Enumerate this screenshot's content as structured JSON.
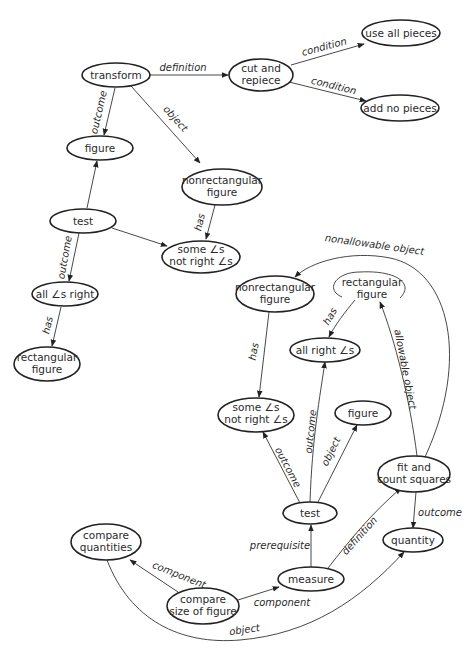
{
  "diagram": {
    "type": "concept-map",
    "nodes": {
      "transform": {
        "label": [
          "transform"
        ],
        "x": 116,
        "y": 75,
        "rx": 33,
        "ry": 12
      },
      "cut_and_repiece": {
        "label": [
          "cut and",
          "repiece"
        ],
        "x": 261,
        "y": 75,
        "rx": 32,
        "ry": 16
      },
      "use_all_pieces": {
        "label": [
          "use all pieces"
        ],
        "x": 400,
        "y": 33,
        "rx": 39,
        "ry": 13
      },
      "add_no_pieces": {
        "label": [
          "add no pieces"
        ],
        "x": 399,
        "y": 108,
        "rx": 39,
        "ry": 13
      },
      "figure_top": {
        "label": [
          "figure"
        ],
        "x": 100,
        "y": 148,
        "rx": 33,
        "ry": 12
      },
      "nonrect_top": {
        "label": [
          "nonrectangular",
          "figure"
        ],
        "x": 220,
        "y": 187,
        "rx": 40,
        "ry": 18
      },
      "test_top": {
        "label": [
          "test"
        ],
        "x": 83,
        "y": 221,
        "rx": 33,
        "ry": 12
      },
      "some_angles_top": {
        "label": [
          "some ∠s",
          "not right ∠s"
        ],
        "x": 200,
        "y": 256,
        "rx": 39,
        "ry": 16
      },
      "all_angles_right": {
        "label": [
          "all ∠s right"
        ],
        "x": 65,
        "y": 294,
        "rx": 33,
        "ry": 12
      },
      "rect_left": {
        "label": [
          "rectangular",
          "figure"
        ],
        "x": 47,
        "y": 364,
        "rx": 33,
        "ry": 17
      },
      "nonrect_mid": {
        "label": [
          "nonrectangular",
          "figure"
        ],
        "x": 275,
        "y": 294,
        "rx": 39,
        "ry": 18
      },
      "rect_mid": {
        "label": [
          "rectangular",
          "figure"
        ],
        "x": 373,
        "y": 287,
        "rx": 38,
        "ry": 15
      },
      "all_right_angles": {
        "label": [
          "all right ∠s"
        ],
        "x": 325,
        "y": 350,
        "rx": 35,
        "ry": 12
      },
      "some_angles_mid": {
        "label": [
          "some ∠s",
          "not right ∠s"
        ],
        "x": 257,
        "y": 415,
        "rx": 38,
        "ry": 17
      },
      "figure_mid": {
        "label": [
          "figure"
        ],
        "x": 362,
        "y": 413,
        "rx": 27,
        "ry": 12
      },
      "fit_and_count": {
        "label": [
          "fit and",
          "count squares"
        ],
        "x": 413,
        "y": 474,
        "rx": 36,
        "ry": 18
      },
      "test_mid": {
        "label": [
          "test"
        ],
        "x": 310,
        "y": 513,
        "rx": 26,
        "ry": 11
      },
      "quantity": {
        "label": [
          "quantity"
        ],
        "x": 413,
        "y": 540,
        "rx": 30,
        "ry": 12
      },
      "compare_quantities": {
        "label": [
          "compare",
          "quantities"
        ],
        "x": 106,
        "y": 542,
        "rx": 35,
        "ry": 18
      },
      "measure": {
        "label": [
          "measure"
        ],
        "x": 311,
        "y": 579,
        "rx": 33,
        "ry": 12
      },
      "compare_size": {
        "label": [
          "compare",
          "size of figure"
        ],
        "x": 203,
        "y": 606,
        "rx": 36,
        "ry": 18
      }
    },
    "edges": [
      {
        "from": "transform",
        "to": "cut_and_repiece",
        "label": "definition"
      },
      {
        "from": "cut_and_repiece",
        "to": "use_all_pieces",
        "label": "condition"
      },
      {
        "from": "cut_and_repiece",
        "to": "add_no_pieces",
        "label": "condition"
      },
      {
        "from": "transform",
        "to": "figure_top",
        "label": "outcome"
      },
      {
        "from": "transform",
        "to": "nonrect_top",
        "label": "object"
      },
      {
        "from": "nonrect_top",
        "to": "some_angles_top",
        "label": "has"
      },
      {
        "from": "test_top",
        "to": "figure_top",
        "label": ""
      },
      {
        "from": "test_top",
        "to": "some_angles_top",
        "label": ""
      },
      {
        "from": "test_top",
        "to": "all_angles_right",
        "label": "outcome"
      },
      {
        "from": "all_angles_right",
        "to": "rect_left",
        "label": "has"
      },
      {
        "from": "fit_and_count",
        "to": "nonrect_mid",
        "label": "nonallowable object"
      },
      {
        "from": "rect_mid",
        "to": "all_right_angles",
        "label": "has"
      },
      {
        "from": "fit_and_count",
        "to": "rect_mid",
        "label": "allowable object"
      },
      {
        "from": "nonrect_mid",
        "to": "some_angles_mid",
        "label": "has"
      },
      {
        "from": "test_mid",
        "to": "some_angles_mid",
        "label": "outcome"
      },
      {
        "from": "test_mid",
        "to": "all_right_angles",
        "label": "outcome"
      },
      {
        "from": "test_mid",
        "to": "figure_mid",
        "label": "object"
      },
      {
        "from": "fit_and_count",
        "to": "quantity",
        "label": "outcome"
      },
      {
        "from": "measure",
        "to": "test_mid",
        "label": "prerequisite"
      },
      {
        "from": "measure",
        "to": "fit_and_count",
        "label": "definition"
      },
      {
        "from": "compare_size",
        "to": "compare_quantities",
        "label": "component"
      },
      {
        "from": "compare_size",
        "to": "measure",
        "label": "component"
      },
      {
        "from": "compare_quantities",
        "to": "quantity",
        "label": "object"
      }
    ]
  },
  "labels": {
    "definition_top": "definition",
    "condition_1": "condition",
    "condition_2": "condition",
    "outcome_transform": "outcome",
    "object_transform": "object",
    "has_nonrect_top": "has",
    "outcome_test_top": "outcome",
    "has_all_right": "has",
    "nonallowable": "nonallowable object",
    "has_rect_mid": "has",
    "allowable": "allowable object",
    "has_nonrect_mid": "has",
    "outcome_some": "outcome",
    "outcome_allright": "outcome",
    "object_figure": "object",
    "outcome_quantity": "outcome",
    "prerequisite": "prerequisite",
    "definition_measure": "definition",
    "component_cq": "component",
    "component_measure": "component",
    "object_quantity": "object"
  },
  "node_text": {
    "transform": "transform",
    "cut_1": "cut and",
    "cut_2": "repiece",
    "use_all": "use all pieces",
    "add_no": "add no pieces",
    "figure_top": "figure",
    "nonrect_top_1": "nonrectangular",
    "nonrect_top_2": "figure",
    "test_top": "test",
    "some_top_1": "some ∠s",
    "some_top_2": "not right ∠s",
    "all_right_left": "all ∠s right",
    "rect_left_1": "rectangular",
    "rect_left_2": "figure",
    "nonrect_mid_1": "nonrectangular",
    "nonrect_mid_2": "figure",
    "rect_mid_1": "rectangular",
    "rect_mid_2": "figure",
    "all_right_mid": "all right ∠s",
    "some_mid_1": "some ∠s",
    "some_mid_2": "not right ∠s",
    "figure_mid": "figure",
    "fit_1": "fit and",
    "fit_2": "count squares",
    "test_mid": "test",
    "quantity": "quantity",
    "cq_1": "compare",
    "cq_2": "quantities",
    "measure": "measure",
    "cs_1": "compare",
    "cs_2": "size of figure"
  },
  "colors": {
    "ink": "#222222",
    "background": "#ffffff"
  }
}
